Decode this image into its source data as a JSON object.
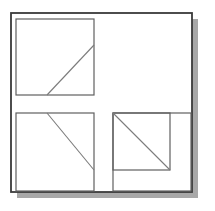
{
  "page": {
    "background_color": "#ffffff",
    "width": 215,
    "height": 211
  },
  "figure": {
    "caption": "",
    "type": "line-art-geometry",
    "stroke_color_frame": "#3a3a3a",
    "stroke_color_square": "#5f5f5f",
    "stroke_color_diagonal": "#7b7b7b",
    "shadow_color": "#a8a8a8",
    "fill_color": "#ffffff",
    "frame": {
      "label": "outer-frame",
      "x": 11,
      "y": 13,
      "width": 181,
      "height": 179,
      "stroke_width": 1.8
    },
    "shadow": {
      "label": "drop-shadow",
      "x": 17,
      "y": 19,
      "width": 181,
      "height": 179,
      "offset_x": 6,
      "offset_y": 6
    },
    "squares": [
      {
        "name": "top-left-square",
        "x": 16,
        "y": 19,
        "width": 78,
        "height": 76,
        "stroke_width": 1.2
      },
      {
        "name": "bottom-left-square",
        "x": 16,
        "y": 113,
        "width": 78,
        "height": 78,
        "stroke_width": 1.2
      },
      {
        "name": "bottom-right-outer-square",
        "x": 113,
        "y": 113,
        "width": 78,
        "height": 78,
        "stroke_width": 1.2
      },
      {
        "name": "bottom-right-inner-square",
        "x": 113,
        "y": 113,
        "width": 57,
        "height": 57,
        "stroke_width": 1.2
      }
    ],
    "diagonals": [
      {
        "name": "top-left-diagonal",
        "x1": 47,
        "y1": 95,
        "x2": 94,
        "y2": 45,
        "direction": "up-right",
        "stroke_width": 1.1
      },
      {
        "name": "bottom-left-diagonal",
        "x1": 47,
        "y1": 113,
        "x2": 94,
        "y2": 170,
        "direction": "down-right",
        "stroke_width": 1.1
      },
      {
        "name": "bottom-right-diagonal",
        "x1": 113,
        "y1": 113,
        "x2": 170,
        "y2": 170,
        "direction": "down-right",
        "stroke_width": 1.1
      }
    ]
  }
}
